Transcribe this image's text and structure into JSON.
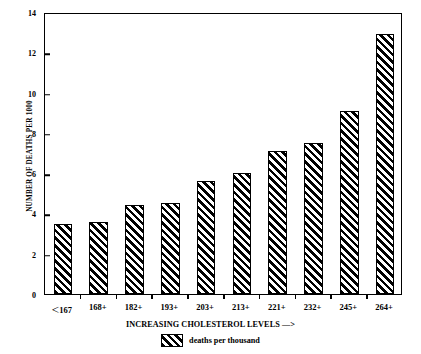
{
  "chart_data": {
    "type": "bar",
    "title": "",
    "xlabel": "INCREASING CHOLESTEROL LEVELS —>",
    "ylabel": "NUMBER OF DEATHS PER 1000",
    "categories": [
      "<167",
      "168+",
      "182+",
      "193+",
      "203+",
      "213+",
      "221+",
      "232+",
      "245+",
      "264+"
    ],
    "values": [
      3.5,
      3.6,
      4.4,
      4.5,
      5.6,
      6.0,
      7.1,
      7.5,
      9.1,
      12.9
    ],
    "series": [
      {
        "name": "deaths per thousand",
        "values": [
          3.5,
          3.6,
          4.4,
          4.5,
          5.6,
          6.0,
          7.1,
          7.5,
          9.1,
          12.9
        ]
      }
    ],
    "ylim": [
      0,
      14
    ],
    "yticks": [
      0,
      2,
      4,
      6,
      8,
      10,
      12,
      14
    ],
    "ytick_labels": [
      "0",
      "2",
      "4",
      "6",
      "8",
      "10",
      "12",
      "14"
    ],
    "grid": false,
    "legend": {
      "position": "bottom-center",
      "entries": [
        {
          "label": "deaths per thousand",
          "pattern": "diagonal-hatch",
          "color": "#000000"
        }
      ]
    },
    "bar_style": {
      "fill_pattern": "diagonal-hatch",
      "hatch_color": "#000000",
      "background_color": "#ffffff",
      "edge_color": "#000000"
    },
    "axis_color": "#000000",
    "frame": true
  }
}
